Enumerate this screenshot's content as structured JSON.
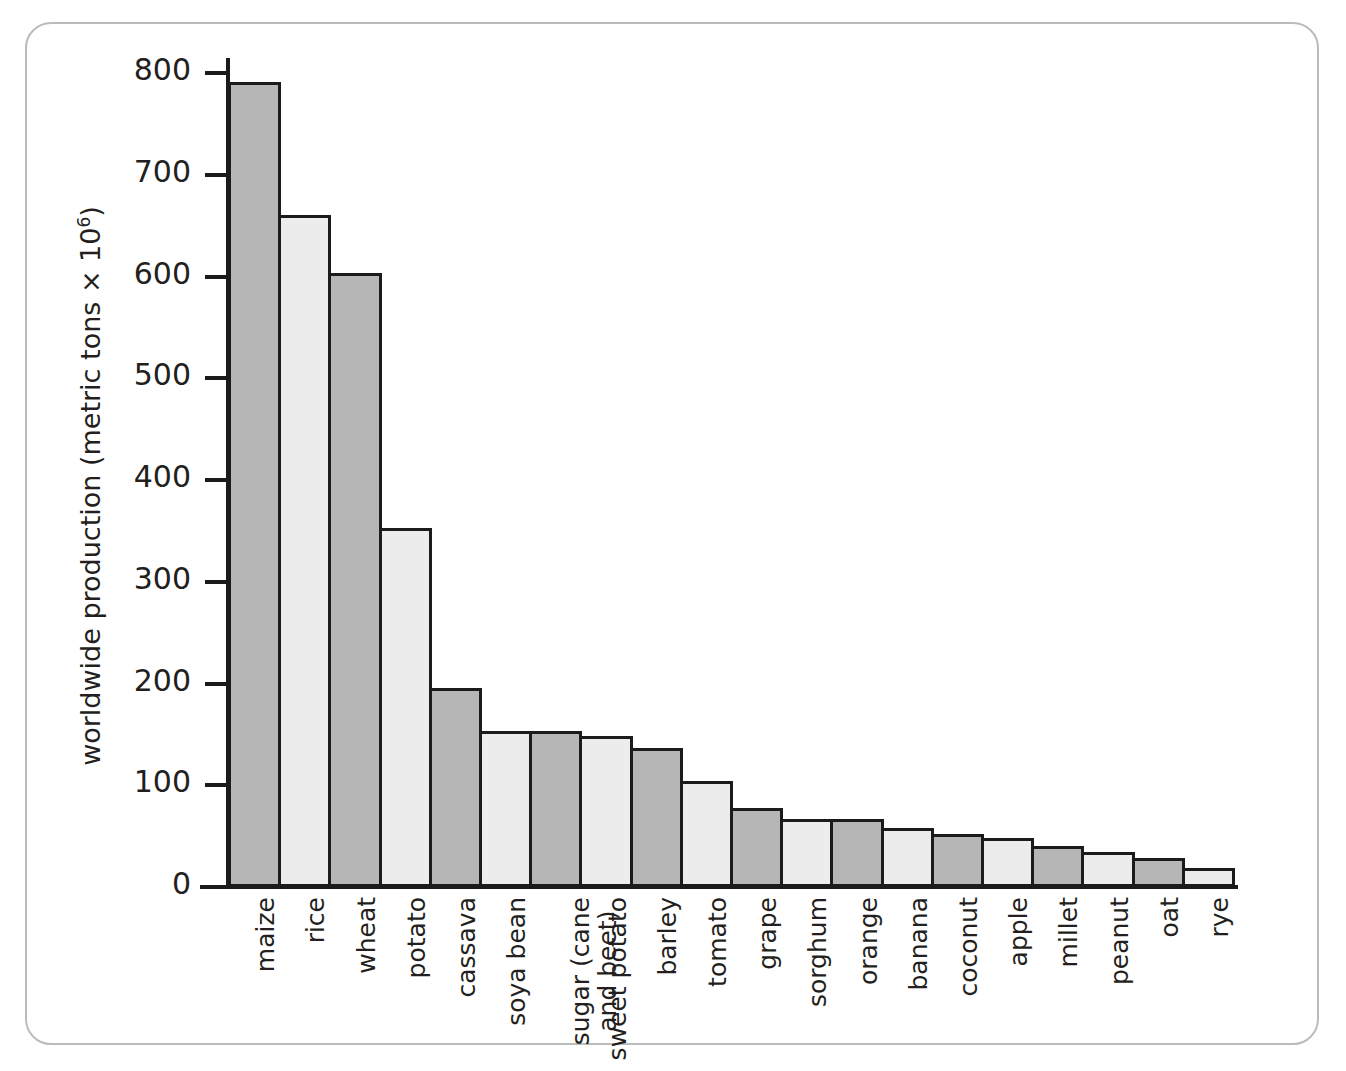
{
  "chart_data": {
    "type": "bar",
    "title": "",
    "xlabel": "",
    "ylabel": "worldwide production (metric tons × 10⁶)",
    "ylabel_parts": {
      "prefix": "worldwide production (metric tons × 10",
      "exponent": "6",
      "suffix": ")"
    },
    "ylim": [
      0,
      830
    ],
    "ytick_values": [
      0,
      100,
      200,
      300,
      400,
      500,
      600,
      700,
      800
    ],
    "ytick_labels": [
      "0",
      "100",
      "200",
      "300",
      "400",
      "500",
      "600",
      "700",
      "800"
    ],
    "grid": false,
    "legend": "none",
    "categories": [
      "maize",
      "rice",
      "wheat",
      "potato",
      "cassava",
      "soya bean",
      "sugar (cane\nand beet)",
      "sweet potato",
      "barley",
      "tomato",
      "grape",
      "sorghum",
      "orange",
      "banana",
      "coconut",
      "apple",
      "millet",
      "peanut",
      "oat",
      "rye"
    ],
    "values": [
      791,
      660,
      603,
      353,
      196,
      153,
      153,
      148,
      137,
      104,
      78,
      67,
      67,
      58,
      52,
      48,
      40,
      34,
      29,
      19
    ],
    "bar_shading": [
      "dark",
      "light",
      "dark",
      "light",
      "dark",
      "light",
      "dark",
      "light",
      "dark",
      "light",
      "dark",
      "light",
      "dark",
      "light",
      "dark",
      "light",
      "dark",
      "light",
      "dark",
      "light"
    ]
  },
  "colors": {
    "bar_dark": "#b6b6b6",
    "bar_light": "#ececec",
    "bar_outline": "#1b1b1b",
    "axis": "#1b1b1b",
    "text": "#231f20",
    "frame_border": "#b9bcbb",
    "background": "#ffffff"
  }
}
